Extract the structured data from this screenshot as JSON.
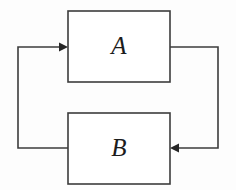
{
  "diagram": {
    "type": "block-feedback-loop",
    "background_color": "#fdfdfd",
    "stroke_color": "#3c3c3c",
    "arrow_fill_color": "#262626",
    "label_color": "#1c1c1c",
    "blocks": [
      {
        "id": "block-a",
        "label": "A",
        "x": 68,
        "y": 11,
        "width": 102,
        "height": 71,
        "label_cx": 119,
        "label_cy": 48
      },
      {
        "id": "block-b",
        "label": "B",
        "x": 68,
        "y": 113,
        "width": 102,
        "height": 71,
        "label_cx": 119,
        "label_cy": 150
      }
    ],
    "connections": [
      {
        "id": "forward-path",
        "from": "block-a",
        "to": "block-b",
        "description": "right side forward path from A down into B",
        "points": "170,47 218,47 218,148 177,148",
        "arrow_direction": "left",
        "arrow_tip_x": 170,
        "arrow_tip_y": 148
      },
      {
        "id": "feedback-path",
        "from": "block-b",
        "to": "block-a",
        "description": "left side feedback path from B up into A",
        "points": "68,148 18,148 18,47 61,47",
        "arrow_direction": "right",
        "arrow_tip_x": 68,
        "arrow_tip_y": 47
      }
    ]
  }
}
